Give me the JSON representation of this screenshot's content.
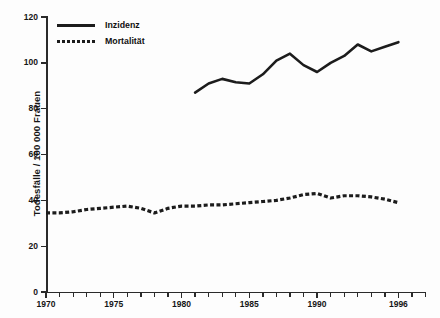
{
  "chart_data": {
    "type": "line",
    "title": "",
    "xlabel": "",
    "ylabel": "Todesfälle / 100 000 Frauen",
    "xlim": [
      1970,
      1998
    ],
    "ylim": [
      0,
      120
    ],
    "grid": false,
    "legend_position": "top-left",
    "x_ticks_major": [
      1970,
      1975,
      1980,
      1985,
      1990,
      1996
    ],
    "x_tick_labels": [
      "1970",
      "1975",
      "1980",
      "1985",
      "1990",
      "1996"
    ],
    "y_ticks": [
      0,
      20,
      40,
      60,
      80,
      100,
      120
    ],
    "y_tick_labels": [
      "0",
      "20",
      "40",
      "60",
      "80",
      "100",
      "120"
    ],
    "series": [
      {
        "name": "Inzidenz",
        "style": "solid",
        "color": "#1c1c1c",
        "x": [
          1981,
          1982,
          1983,
          1984,
          1985,
          1986,
          1987,
          1988,
          1989,
          1990,
          1991,
          1992,
          1993,
          1994,
          1995,
          1996
        ],
        "values": [
          87,
          91,
          93,
          91.5,
          91,
          95,
          101,
          104,
          99,
          96,
          100,
          103,
          108,
          105,
          107,
          109
        ]
      },
      {
        "name": "Mortalität",
        "style": "dashed",
        "color": "#1c1c1c",
        "x": [
          1970,
          1971,
          1972,
          1973,
          1974,
          1975,
          1976,
          1977,
          1978,
          1979,
          1980,
          1981,
          1982,
          1983,
          1984,
          1985,
          1986,
          1987,
          1988,
          1989,
          1990,
          1991,
          1992,
          1993,
          1994,
          1995,
          1996
        ],
        "values": [
          34.5,
          34.5,
          35,
          36,
          36.5,
          37,
          37.5,
          36.5,
          34.5,
          36.5,
          37.5,
          37.5,
          38,
          38,
          38.5,
          39,
          39.5,
          40,
          41,
          42.5,
          43,
          41,
          42,
          42,
          41.5,
          40.5,
          39
        ]
      }
    ]
  },
  "legend": {
    "items": [
      {
        "label": "Inzidenz",
        "style": "solid"
      },
      {
        "label": "Mortalität",
        "style": "dashed"
      }
    ]
  },
  "axes": {
    "y_title": "Todesfälle / 100 000 Frauen"
  }
}
